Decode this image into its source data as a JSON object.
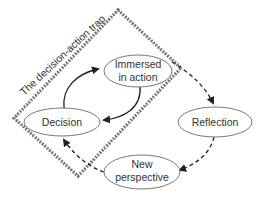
{
  "diagram": {
    "trap_label": "The decision-action trap",
    "nodes": [
      {
        "id": "immersed",
        "line1": "Immersed",
        "line2": "in action"
      },
      {
        "id": "decision",
        "line1": "Decision"
      },
      {
        "id": "reflection",
        "line1": "Reflection"
      },
      {
        "id": "new_perspective",
        "line1": "New",
        "line2": "perspective"
      }
    ],
    "edges": [
      {
        "from": "decision",
        "to": "immersed",
        "style": "solid"
      },
      {
        "from": "immersed",
        "to": "decision",
        "style": "solid"
      },
      {
        "from": "immersed",
        "to": "reflection",
        "style": "dashed"
      },
      {
        "from": "reflection",
        "to": "new_perspective",
        "style": "dashed"
      },
      {
        "from": "new_perspective",
        "to": "decision",
        "style": "dashed"
      }
    ],
    "colors": {
      "stroke": "#333333",
      "node_stroke": "#777777",
      "trap_border": "#555555"
    }
  }
}
